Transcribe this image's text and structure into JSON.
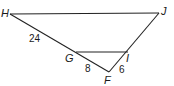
{
  "diagram": {
    "type": "triangle-with-parallel-segment",
    "points": {
      "H": {
        "label": "H",
        "x": 10,
        "y": 14
      },
      "J": {
        "label": "J",
        "x": 159,
        "y": 13
      },
      "F": {
        "label": "F",
        "x": 109,
        "y": 72
      },
      "G": {
        "label": "G",
        "x": 76,
        "y": 52
      },
      "I": {
        "label": "I",
        "x": 128,
        "y": 52
      }
    },
    "segments": [
      {
        "from": "H",
        "to": "J"
      },
      {
        "from": "H",
        "to": "F"
      },
      {
        "from": "J",
        "to": "F"
      },
      {
        "from": "G",
        "to": "I"
      }
    ],
    "measures": {
      "HG": "24",
      "GF": "8",
      "IF": "6"
    },
    "stroke_color": "#222222"
  }
}
